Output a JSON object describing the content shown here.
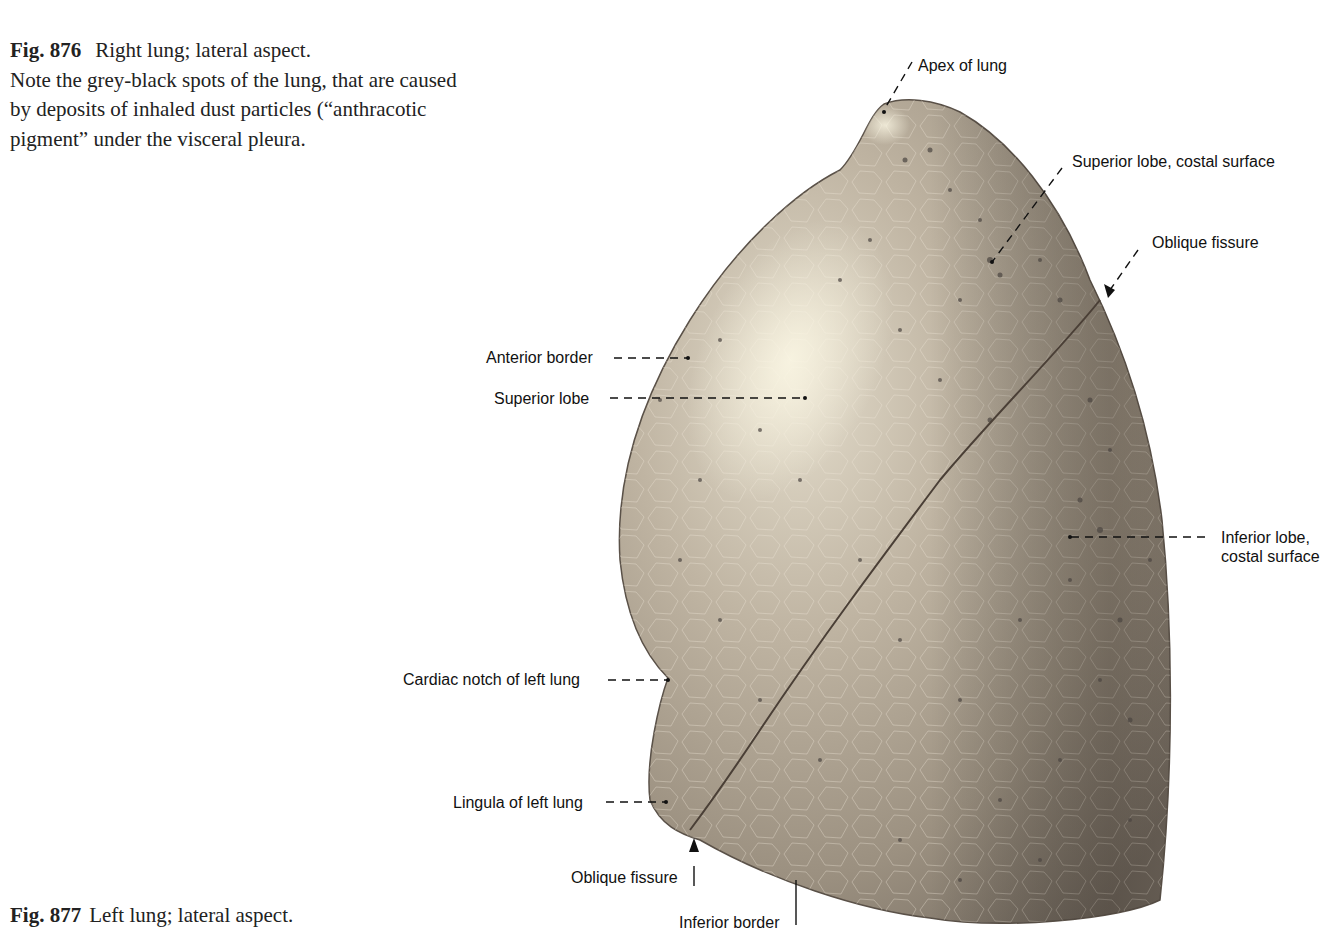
{
  "fig876": {
    "number": "Fig. 876",
    "title": "Right lung; lateral aspect.",
    "note_line1": "Note the grey-black spots of the lung, that are caused",
    "note_line2": "by deposits of inhaled dust particles (“anthracotic",
    "note_line3": "pigment” under the visceral pleura."
  },
  "fig877": {
    "number": "Fig. 877",
    "title": "Left lung; lateral aspect."
  },
  "labels": {
    "apex": "Apex of lung",
    "superior_lobe_costal": "Superior lobe, costal surface",
    "oblique_fissure_top": "Oblique fissure",
    "anterior_border": "Anterior border",
    "superior_lobe": "Superior lobe",
    "inferior_lobe_line1": "Inferior lobe,",
    "inferior_lobe_line2": "costal surface",
    "cardiac_notch": "Cardiac notch of left lung",
    "lingula": "Lingula of left lung",
    "oblique_fissure_bottom": "Oblique fissure",
    "inferior_border": "Inferior border"
  },
  "colors": {
    "lung_light": "#d8d0bf",
    "lung_mid": "#a89d8c",
    "lung_dark": "#6f665c",
    "spot": "#4a4540",
    "leader": "#111111"
  }
}
